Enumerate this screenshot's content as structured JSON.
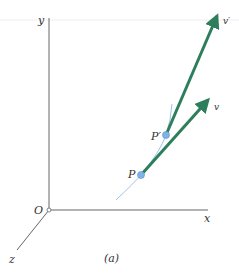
{
  "figure": {
    "caption": "(a)",
    "axes": {
      "x_label": "x",
      "y_label": "y",
      "z_label": "z",
      "origin_label": "O"
    },
    "points": [
      {
        "id": "P",
        "label": "P"
      },
      {
        "id": "P_prime",
        "label": "P′"
      }
    ],
    "vectors": [
      {
        "id": "v",
        "label": "v"
      },
      {
        "id": "v_prime",
        "label": "v′"
      }
    ],
    "colors": {
      "vector": "#2e7d5b",
      "point": "#7fb2e8",
      "curve": "#9cc4e8",
      "axis": "#555555"
    }
  }
}
